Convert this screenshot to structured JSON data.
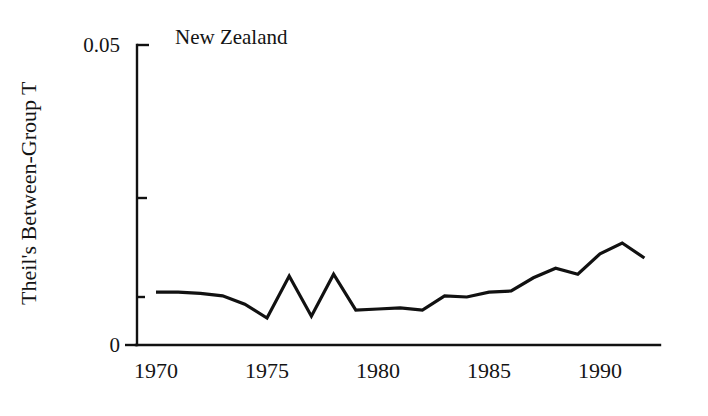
{
  "figure": {
    "title": "New Zealand",
    "background_color": "#ffffff",
    "line_color": "#111111",
    "axis_color": "#111111",
    "text_color": "#141414"
  },
  "axes": {
    "y_label": "Theil's Between-Group T",
    "y_ticks": [
      "0.05",
      "0"
    ],
    "y_tick_values": [
      0.05,
      0
    ],
    "y_minor_tick_value": 0.025,
    "x_ticks": [
      "1970",
      "1975",
      "1980",
      "1985",
      "1990"
    ],
    "x_tick_values": [
      1970,
      1975,
      1980,
      1985,
      1990
    ]
  },
  "chart_data": {
    "type": "line",
    "title": "New Zealand",
    "xlabel": "",
    "ylabel": "Theil's Between-Group T",
    "xlim": [
      1970,
      1993.5
    ],
    "ylim": [
      0,
      0.05
    ],
    "grid": false,
    "legend": false,
    "x": [
      1970,
      1971,
      1972,
      1973,
      1974,
      1975,
      1976,
      1977,
      1978,
      1979,
      1980,
      1981,
      1982,
      1983,
      1984,
      1985,
      1986,
      1987,
      1988,
      1989,
      1990,
      1991,
      1992
    ],
    "series": [
      {
        "name": "Theil's Between-Group T",
        "values": [
          0.0088,
          0.0088,
          0.0086,
          0.0082,
          0.0068,
          0.0045,
          0.0115,
          0.0048,
          0.0118,
          0.0058,
          0.006,
          0.0062,
          0.0058,
          0.0082,
          0.008,
          0.0088,
          0.009,
          0.0112,
          0.0128,
          0.0118,
          0.0152,
          0.017,
          0.0145
        ]
      }
    ]
  },
  "geometry": {
    "plot_left": 137,
    "plot_right": 660,
    "plot_top": 45,
    "plot_bottom": 345,
    "x_at_1970": 156,
    "x_at_1990": 600,
    "px_per_year": 22.2
  }
}
